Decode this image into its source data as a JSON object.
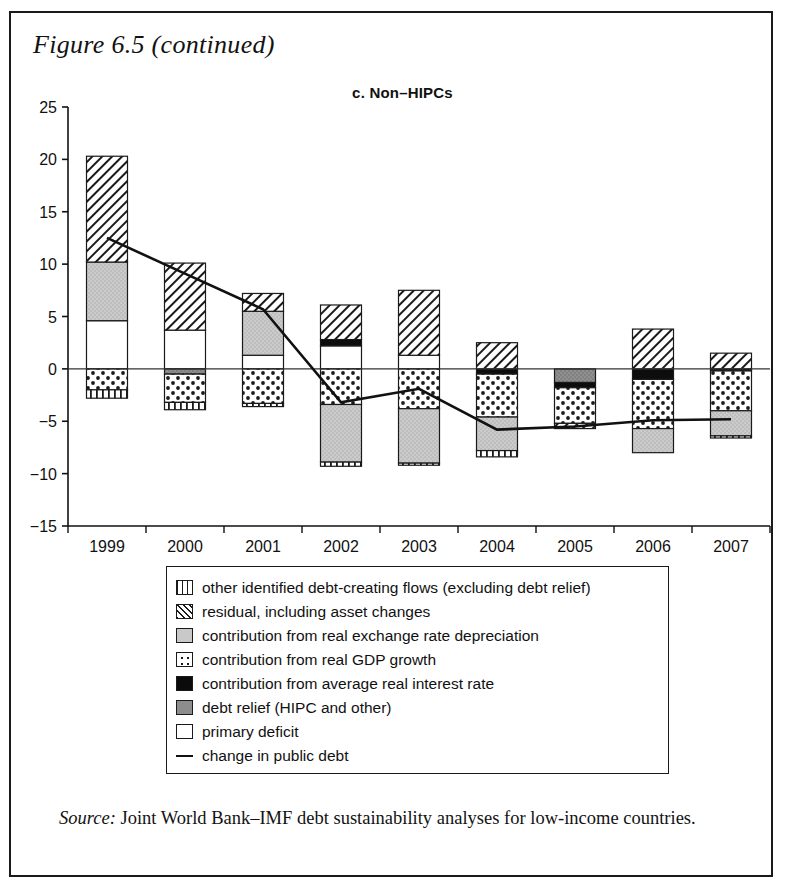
{
  "figure": {
    "title": "Figure 6.5 (continued)",
    "panel_title": "c. Non–HIPCs"
  },
  "source": {
    "label": "Source:",
    "text": " Joint World Bank–IMF debt sustainability analyses for low-income countries."
  },
  "legend": {
    "items": [
      {
        "key": "other-flows",
        "pattern": "vertical-lines",
        "label": "other identified debt-creating flows (excluding debt relief)"
      },
      {
        "key": "residual",
        "pattern": "diagonal-hatch",
        "label": "residual, including asset changes"
      },
      {
        "key": "exchange-rate",
        "pattern": "light-gray",
        "label": "contribution from real exchange rate depreciation"
      },
      {
        "key": "gdp-growth",
        "pattern": "dotted",
        "label": "contribution from real GDP growth"
      },
      {
        "key": "interest-rate",
        "pattern": "solid-black",
        "label": "contribution from average real interest rate"
      },
      {
        "key": "debt-relief",
        "pattern": "medium-gray",
        "label": "debt relief (HIPC and other)"
      },
      {
        "key": "primary-deficit",
        "pattern": "white",
        "label": "primary deficit"
      },
      {
        "key": "change-public-debt",
        "pattern": "line",
        "label": "change in public debt"
      }
    ]
  },
  "chart_data": {
    "type": "bar",
    "subtype": "stacked-bar-with-line",
    "title": "c. Non–HIPCs",
    "xlabel": "",
    "ylabel": "",
    "ylim": [
      -15,
      25
    ],
    "yticks": [
      25,
      20,
      15,
      10,
      5,
      0,
      -5,
      -10,
      -15
    ],
    "grid": false,
    "legend_position": "below-plot",
    "categories": [
      "1999",
      "2000",
      "2001",
      "2002",
      "2003",
      "2004",
      "2005",
      "2006",
      "2007"
    ],
    "series": [
      {
        "name": "primary deficit",
        "key": "primary-deficit",
        "pattern": "white",
        "values": [
          4.6,
          3.7,
          1.3,
          2.2,
          1.3,
          0.0,
          0.0,
          0.0,
          0.0
        ]
      },
      {
        "name": "debt relief (HIPC and other)",
        "key": "debt-relief",
        "pattern": "medium-gray",
        "values": [
          0.0,
          -0.5,
          0.0,
          0.0,
          0.0,
          0.0,
          -1.3,
          0.0,
          0.0
        ]
      },
      {
        "name": "contribution from average real interest rate",
        "key": "interest-rate",
        "pattern": "solid-black",
        "values": [
          0.0,
          0.0,
          0.0,
          0.6,
          0.0,
          -0.5,
          -0.5,
          -1.0,
          -0.2
        ]
      },
      {
        "name": "contribution from real GDP growth",
        "key": "gdp-growth",
        "pattern": "dotted",
        "values": [
          -2.0,
          -2.7,
          -3.3,
          -3.4,
          -3.8,
          -4.1,
          -3.4,
          -4.7,
          -3.8
        ]
      },
      {
        "name": "contribution from real exchange rate depreciation",
        "key": "exchange-rate",
        "pattern": "light-gray",
        "values": [
          5.6,
          0.0,
          4.2,
          -5.5,
          -5.2,
          -3.2,
          0.0,
          -2.3,
          -2.4
        ]
      },
      {
        "name": "residual, including asset changes",
        "key": "residual",
        "pattern": "diagonal-hatch",
        "values": [
          10.1,
          6.4,
          1.7,
          3.3,
          6.2,
          2.5,
          -0.5,
          3.8,
          1.5
        ]
      },
      {
        "name": "other identified debt-creating flows (excluding debt relief)",
        "key": "other-flows",
        "pattern": "vertical-lines",
        "values": [
          -0.8,
          -0.7,
          -0.3,
          -0.4,
          -0.2,
          -0.6,
          0.0,
          0.0,
          -0.2
        ]
      }
    ],
    "totals_positive": [
      20.3,
      10.1,
      7.2,
      6.1,
      7.5,
      2.5,
      0.0,
      3.8,
      1.5
    ],
    "totals_negative": [
      -2.8,
      -3.9,
      -3.6,
      -9.3,
      -9.2,
      -8.4,
      -5.7,
      -8.0,
      -6.6
    ],
    "line": {
      "name": "change in public debt",
      "values": [
        12.5,
        9.1,
        5.7,
        -3.2,
        -1.9,
        -5.8,
        -5.5,
        -4.9,
        -4.8
      ]
    }
  }
}
